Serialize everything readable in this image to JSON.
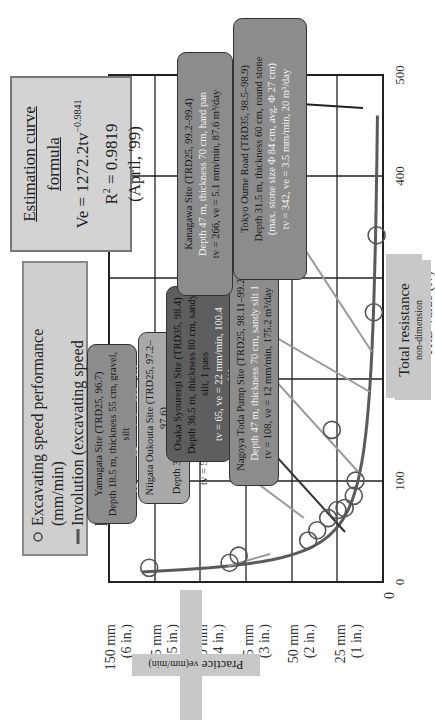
{
  "chart_data": {
    "type": "scatter",
    "title": "",
    "xlabel": "TRD value (tv)",
    "ylabel": "Practice ve(mm/min)",
    "xlim": [
      0,
      500
    ],
    "ylim": [
      0,
      150
    ],
    "grid": true,
    "x_ticks": [
      "0",
      "100",
      "200",
      "300",
      "400",
      "500"
    ],
    "y_ticks": [
      {
        "main": "0",
        "sub": ""
      },
      {
        "main": "25 mm",
        "sub": "(1 in.)"
      },
      {
        "main": "50 mm",
        "sub": "(2 in.)"
      },
      {
        "main": "75 mm",
        "sub": "(3 in.)"
      },
      {
        "main": "100 mm",
        "sub": "(4 in.)"
      },
      {
        "main": "125 mm",
        "sub": "(5 in.)"
      },
      {
        "main": "150 mm",
        "sub": "(6 in.)"
      }
    ],
    "series": [
      {
        "name": "Excavating speed performance (mm/min)",
        "kind": "scatter",
        "x": [
          14,
          19,
          26,
          41,
          51,
          63,
          71,
          73,
          85,
          100,
          150,
          266,
          342
        ],
        "y": [
          128,
          84,
          79,
          41,
          36,
          30,
          25,
          21,
          16,
          15,
          28,
          5,
          3.5
        ]
      },
      {
        "name": "Involution (excavating speed performance [mm/min])",
        "kind": "line",
        "formula": "Ve = 1272.2tv^-0.9841"
      }
    ],
    "legend_position": "upper-left",
    "annotations": [
      "Estimation curve formula",
      "Ve = 1272.2tv^-0.9841",
      "R^2 = 0.9819",
      "(April, '99)"
    ]
  },
  "formula_box": {
    "title": "Estimation curve formula",
    "eq_prefix": "Ve = 1272.2tv",
    "eq_exp": "−0.9841",
    "r2_prefix": "R",
    "r2_sup": "2",
    "r2_value": " = 0.9819",
    "date": "(April, '99)"
  },
  "legend": {
    "item1": "Excavating speed performance (mm/min)",
    "item2_line1": "Involution (excavating speed",
    "item2_line2": "performance [mm/min])"
  },
  "sites": {
    "yamagata": {
      "l1": "Yamagata Site (TRD25, 96.7)",
      "l2": "Depth 18.5 m, thickness 55 cm, gravel, silt",
      "l3": "tv = 13, ve = 85 mm/min, 600 m³/day"
    },
    "niigata": {
      "l1": "Niigata Oukouta Site (TRD25, 97.2–97.6)",
      "l2": "Depth 37 m, thickness 60 cm, sandy silt",
      "l3": "tv = 56, ve = 25 mm/min, 135.4 m³/day"
    },
    "osaka": {
      "l1": "Osaka Syourenji Site (TRD35, 98.4)",
      "l2": "Depth 36.5 m, thickness 80 cm, sandy silt, 1 pass",
      "l3": "tv = 65, ve = 22 mm/min, 100.4 m³/day"
    },
    "nagoya": {
      "l1": "Nagoya Toda Pump Site (TRD25, 98.11–99.2)",
      "l2": "Depth 47 m, thickness 70 cm, sandy silt 1",
      "l3": "tv = 108, ve = 12 mm/min, 175.2 m³/day"
    },
    "kanagawa": {
      "l1": "Kanagawa Site (TRD25, 99.2–99.4)",
      "l2": "Depth 47 m, thickness 70 cm, hard pan",
      "l3": "tv = 266, ve = 5.1 mm/min, 87.6 m³/day"
    },
    "tokyo": {
      "l1": "Tokyo Oume Road (TRD35, 98.5–98.9)",
      "l2": "Depth 31.5 m, thickness 60 cm, round stone",
      "l3": "(max. stone size Φ 84 cm, avg. Φ 27 cm)",
      "l4": "tv = 342, ve = 3.5 mm/min, 20 m³/day"
    }
  },
  "axis_notes": {
    "x_title": "TRD value (tv)",
    "x_note_main": "Total resistance",
    "x_note_sub": "non-dimension",
    "y_note_main": "Practice",
    "y_note_sub": "ve(mm/min)"
  },
  "colors": {
    "curve": "#5a5a5a",
    "marker": "#555555",
    "arrow_dark": "#333333",
    "arrow_light": "#9a9a9a",
    "grid": "#222222"
  }
}
